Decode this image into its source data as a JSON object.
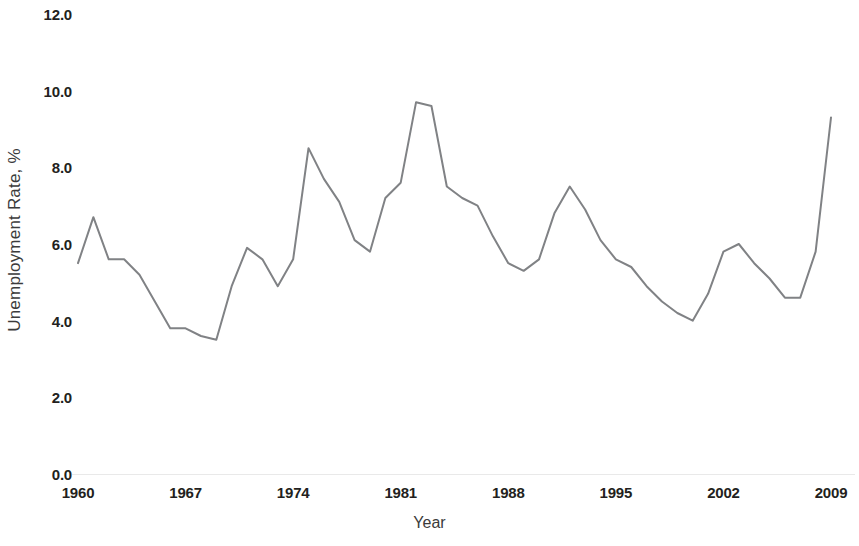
{
  "chart_data": {
    "type": "line",
    "title": "",
    "xlabel": "Year",
    "ylabel": "Unemployment Rate, %",
    "xlim": [
      1960,
      2009
    ],
    "ylim": [
      0.0,
      12.0
    ],
    "grid": false,
    "legend": null,
    "line_color": "#808285",
    "x_ticks": [
      "1960",
      "1967",
      "1974",
      "1981",
      "1988",
      "1995",
      "2002",
      "2009"
    ],
    "x_tick_values": [
      1960,
      1967,
      1974,
      1981,
      1988,
      1995,
      2002,
      2009
    ],
    "y_ticks": [
      "0.0",
      "2.0",
      "4.0",
      "6.0",
      "8.0",
      "10.0",
      "12.0"
    ],
    "y_tick_values": [
      0.0,
      2.0,
      4.0,
      6.0,
      8.0,
      10.0,
      12.0
    ],
    "x": [
      1960,
      1961,
      1962,
      1963,
      1964,
      1965,
      1966,
      1967,
      1968,
      1969,
      1970,
      1971,
      1972,
      1973,
      1974,
      1975,
      1976,
      1977,
      1978,
      1979,
      1980,
      1981,
      1982,
      1983,
      1984,
      1985,
      1986,
      1987,
      1988,
      1989,
      1990,
      1991,
      1992,
      1993,
      1994,
      1995,
      1996,
      1997,
      1998,
      1999,
      2000,
      2001,
      2002,
      2003,
      2004,
      2005,
      2006,
      2007,
      2008,
      2009
    ],
    "values": [
      5.5,
      6.7,
      5.6,
      5.6,
      5.2,
      4.5,
      3.8,
      3.8,
      3.6,
      3.5,
      4.9,
      5.9,
      5.6,
      4.9,
      5.6,
      8.5,
      7.7,
      7.1,
      6.1,
      5.8,
      7.2,
      7.6,
      9.7,
      9.6,
      7.5,
      7.2,
      7.0,
      6.2,
      5.5,
      5.3,
      5.6,
      6.8,
      7.5,
      6.9,
      6.1,
      5.6,
      5.4,
      4.9,
      4.5,
      4.2,
      4.0,
      4.7,
      5.8,
      6.0,
      5.5,
      5.1,
      4.6,
      4.6,
      5.8,
      9.3
    ],
    "series": [
      {
        "name": "Unemployment Rate",
        "values": [
          5.5,
          6.7,
          5.6,
          5.6,
          5.2,
          4.5,
          3.8,
          3.8,
          3.6,
          3.5,
          4.9,
          5.9,
          5.6,
          4.9,
          5.6,
          8.5,
          7.7,
          7.1,
          6.1,
          5.8,
          7.2,
          7.6,
          9.7,
          9.6,
          7.5,
          7.2,
          7.0,
          6.2,
          5.5,
          5.3,
          5.6,
          6.8,
          7.5,
          6.9,
          6.1,
          5.6,
          5.4,
          4.9,
          4.5,
          4.2,
          4.0,
          4.7,
          5.8,
          6.0,
          5.5,
          5.1,
          4.6,
          4.6,
          5.8,
          9.3
        ]
      }
    ]
  },
  "axes": {
    "y_label_text": "Unemployment Rate, %",
    "x_label_text": "Year"
  }
}
